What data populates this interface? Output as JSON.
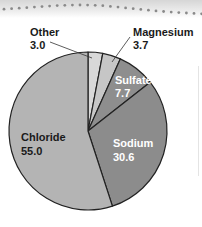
{
  "chart_data": {
    "type": "pie",
    "title": "",
    "categories": [
      "Other",
      "Magnesium",
      "Sulfate",
      "Sodium",
      "Chloride"
    ],
    "values": [
      3.0,
      3.7,
      7.7,
      30.6,
      55.0
    ],
    "colors": [
      "#d8d8d8",
      "#c6c6c6",
      "#8e8e8e",
      "#8c8c8c",
      "#b4b4b4"
    ],
    "label_colors": [
      "#1a1a1a",
      "#1a1a1a",
      "#ffffff",
      "#ffffff",
      "#1a1a1a"
    ],
    "value_labels": [
      "3.0",
      "3.7",
      "7.7",
      "30.6",
      "55.0"
    ],
    "start_angle": "top, clockwise",
    "legend": "none (direct labels)"
  },
  "labels": {
    "other": {
      "name": "Other",
      "value": "3.0"
    },
    "magnesium": {
      "name": "Magnesium",
      "value": "3.7"
    },
    "sulfate": {
      "name": "Sulfate",
      "value": "7.7"
    },
    "sodium": {
      "name": "Sodium",
      "value": "30.6"
    },
    "chloride": {
      "name": "Chloride",
      "value": "55.0"
    }
  }
}
